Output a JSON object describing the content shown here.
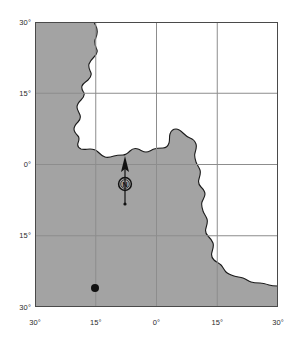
{
  "map": {
    "title": "Map of Africa with study site location",
    "projection_note": "latitude-longitude grid",
    "land_color": "#a3a3a3",
    "ocean_color": "#ffffff",
    "frame_color": "#4a4a4a",
    "coastline_color": "#1a1a1a",
    "gridline_color": "#8d8d8d",
    "marker_color": "#111111",
    "axes": {
      "x_label": "",
      "y_label": "",
      "x_ticks": [
        {
          "label": "30°",
          "value": -30,
          "hemisphere": "W"
        },
        {
          "label": "15°",
          "value": -15,
          "hemisphere": "W"
        },
        {
          "label": "0°",
          "value": 0,
          "hemisphere": ""
        },
        {
          "label": "15°",
          "value": 15,
          "hemisphere": "E"
        },
        {
          "label": "30°",
          "value": 30,
          "hemisphere": "E"
        }
      ],
      "y_ticks": [
        {
          "label": "30°",
          "value": 30,
          "hemisphere": "N"
        },
        {
          "label": "15°",
          "value": 15,
          "hemisphere": "N"
        },
        {
          "label": "0°",
          "value": 0,
          "hemisphere": ""
        },
        {
          "label": "15°",
          "value": -15,
          "hemisphere": "S"
        },
        {
          "label": "30°",
          "value": -30,
          "hemisphere": "S"
        }
      ],
      "x_range": [
        -30,
        30
      ],
      "y_range": [
        -30,
        30
      ],
      "grid": true
    },
    "compass": {
      "label": "N",
      "icon": "north-arrow-icon",
      "bearing_degrees": 0
    },
    "marker": {
      "icon": "location-dot-icon",
      "label": "",
      "longitude": -15,
      "latitude": -30
    }
  }
}
